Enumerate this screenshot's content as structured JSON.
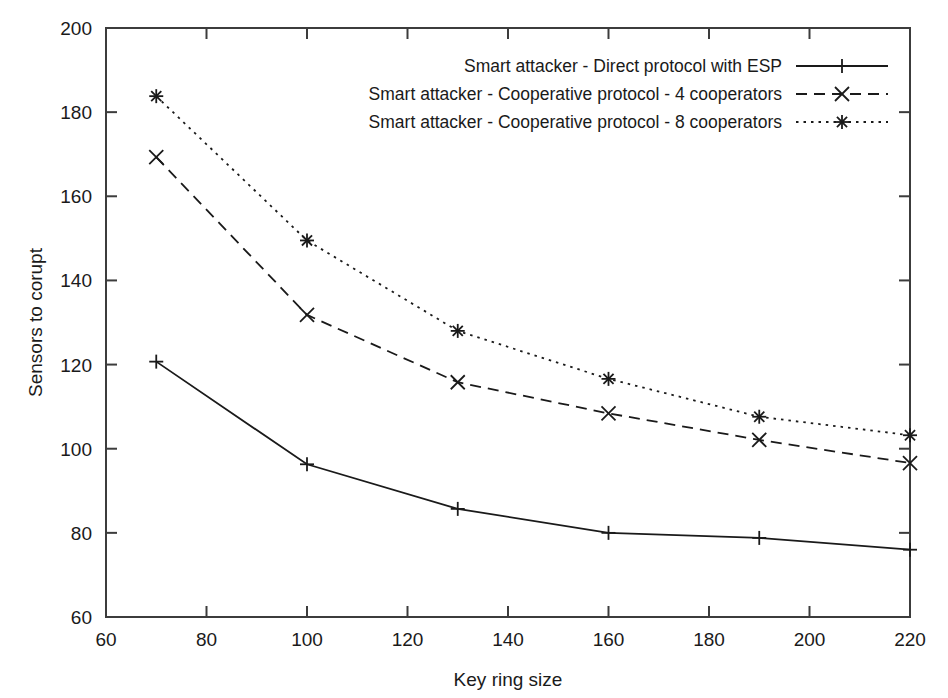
{
  "chart_data": {
    "type": "line",
    "title": "",
    "xlabel": "Key ring size",
    "ylabel": "Sensors to corupt",
    "xlim": [
      60,
      220
    ],
    "ylim": [
      60,
      200
    ],
    "xticks": [
      60,
      80,
      100,
      120,
      140,
      160,
      180,
      200,
      220
    ],
    "yticks": [
      60,
      80,
      100,
      120,
      140,
      160,
      180,
      200
    ],
    "grid": false,
    "legend_position": "top-right",
    "x": [
      70,
      100,
      130,
      160,
      190,
      220
    ],
    "series": [
      {
        "name": "Smart attacker - Direct protocol with ESP",
        "marker": "plus",
        "dash": "solid",
        "values": [
          120.7,
          96.3,
          85.7,
          80.0,
          78.8,
          76.0
        ]
      },
      {
        "name": "Smart attacker - Cooperative protocol - 4 cooperators",
        "marker": "cross",
        "dash": "dashed",
        "values": [
          169.3,
          131.8,
          115.8,
          108.4,
          102.1,
          96.6
        ]
      },
      {
        "name": "Smart attacker - Cooperative protocol - 8 cooperators",
        "marker": "star",
        "dash": "dotted",
        "values": [
          183.8,
          149.5,
          128.0,
          116.6,
          107.6,
          103.2
        ]
      }
    ]
  },
  "axes": {
    "x_title": "Key ring size",
    "y_title": "Sensors to corupt",
    "x_tick_labels": [
      "60",
      "80",
      "100",
      "120",
      "140",
      "160",
      "180",
      "200",
      "220"
    ],
    "y_tick_labels": [
      "60",
      "80",
      "100",
      "120",
      "140",
      "160",
      "180",
      "200"
    ]
  },
  "legend": {
    "entries": [
      "Smart attacker - Direct protocol with ESP",
      "Smart attacker - Cooperative protocol - 4 cooperators",
      "Smart attacker - Cooperative protocol - 8 cooperators"
    ]
  },
  "colors": {
    "ink": "#1a1a1a",
    "frame": "#3c3c3c",
    "background": "#ffffff"
  }
}
